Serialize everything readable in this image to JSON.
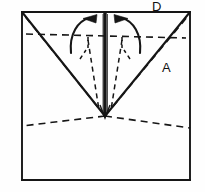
{
  "figure": {
    "kind": "origami-fold-diagram",
    "canvas": {
      "width": 205,
      "height": 192
    },
    "style": {
      "line_color": "#161616",
      "background_color": "#fefefe",
      "solid_stroke_width": 1.9,
      "dashed_stroke_width": 1.6,
      "center_stroke_width": 3.2,
      "dash_pattern": "7 5",
      "short_dash_pattern": "4 3.5"
    },
    "labels": [
      {
        "id": "D",
        "text": "D",
        "x": 152,
        "y": 0,
        "note": "vertex label above top-right corner"
      },
      {
        "id": "A",
        "text": "A",
        "x": 162,
        "y": 61,
        "note": "label on right flap near solid diagonal"
      }
    ],
    "sheet_outline": {
      "name": "square-sheet-outline",
      "corners": {
        "top_left": [
          22,
          12
        ],
        "top_right": [
          190,
          12
        ],
        "bottom_right": [
          190,
          180
        ],
        "bottom_left": [
          22,
          180
        ]
      }
    },
    "solid_lines": [
      {
        "name": "outline-top-edge",
        "from": [
          22,
          12
        ],
        "to": [
          190,
          12
        ]
      },
      {
        "name": "outline-left-edge",
        "from": [
          22,
          12
        ],
        "to": [
          22,
          180
        ]
      },
      {
        "name": "outline-right-edge",
        "from": [
          190,
          12
        ],
        "to": [
          190,
          180
        ]
      },
      {
        "name": "outline-bottom-edge",
        "from": [
          22,
          180
        ],
        "to": [
          190,
          180
        ]
      },
      {
        "name": "left-folded-edge",
        "from": [
          22,
          12
        ],
        "to": [
          105,
          116
        ]
      },
      {
        "name": "right-folded-edge",
        "from": [
          190,
          12
        ],
        "to": [
          105,
          116
        ]
      },
      {
        "name": "center-vertical-fold",
        "from": [
          105,
          12
        ],
        "to": [
          105,
          117
        ]
      }
    ],
    "dashed_lines": [
      {
        "name": "horizontal-midline-crease",
        "from": [
          26,
          34
        ],
        "to": [
          186,
          38
        ]
      },
      {
        "name": "left-crease-to-top-left",
        "from": [
          105,
          116
        ],
        "to": [
          24,
          15
        ]
      },
      {
        "name": "right-crease-to-top-right",
        "from": [
          105,
          116
        ],
        "to": [
          188,
          16
        ]
      },
      {
        "name": "left-lower-crease",
        "from": [
          105,
          116
        ],
        "to": [
          22,
          126
        ]
      },
      {
        "name": "right-lower-crease",
        "from": [
          105,
          116
        ],
        "to": [
          190,
          128
        ]
      },
      {
        "name": "left-inner-crease-vertical",
        "from": [
          88,
          36
        ],
        "to": [
          99,
          110
        ]
      },
      {
        "name": "right-inner-crease-vertical",
        "from": [
          122,
          36
        ],
        "to": [
          111,
          110
        ]
      },
      {
        "name": "left-angle-tick-vertical",
        "from": [
          88,
          38
        ],
        "to": [
          88,
          47
        ]
      },
      {
        "name": "right-angle-tick-vertical",
        "from": [
          122,
          38
        ],
        "to": [
          122,
          47
        ]
      },
      {
        "name": "left-angle-tick-small",
        "from": [
          81,
          57
        ],
        "to": [
          85,
          51
        ]
      },
      {
        "name": "right-angle-tick-small",
        "from": [
          129,
          57
        ],
        "to": [
          125,
          51
        ]
      }
    ],
    "fold_arrows": [
      {
        "name": "left-fold-arrow",
        "direction": "right",
        "note": "left flap rotates up and inward toward center",
        "path": "M 71 52 C 70 34 78 21 90 18",
        "head": [
          [
            95,
            15
          ],
          [
            95,
            22
          ],
          [
            84,
            19
          ]
        ]
      },
      {
        "name": "right-fold-arrow",
        "direction": "left",
        "note": "right flap rotates up and inward toward center",
        "path": "M 140 52 C 141 34 133 21 121 18",
        "head": [
          [
            116,
            15
          ],
          [
            116,
            22
          ],
          [
            127,
            19
          ]
        ]
      }
    ]
  }
}
